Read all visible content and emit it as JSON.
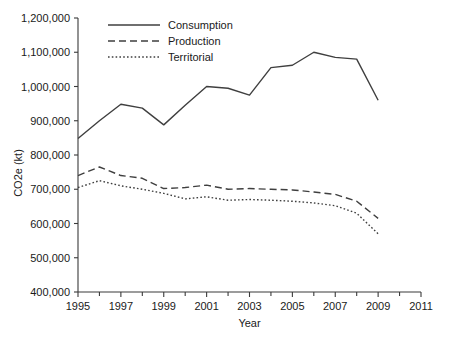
{
  "chart_data": {
    "type": "line",
    "title": "",
    "xlabel": "Year",
    "ylabel": "CO2e (kt)",
    "xlim": [
      1995,
      2011
    ],
    "ylim": [
      400000,
      1200000
    ],
    "grid": false,
    "legend_position": "top-center",
    "x_tick_labels": [
      "1995",
      "1997",
      "1999",
      "2001",
      "2003",
      "2005",
      "2007",
      "2009",
      "2011"
    ],
    "x_tick_values": [
      1995,
      1997,
      1999,
      2001,
      2003,
      2005,
      2007,
      2009,
      2011
    ],
    "x_minor_tick_values": [
      1996,
      1998,
      2000,
      2002,
      2004,
      2006,
      2008,
      2010
    ],
    "y_tick_labels": [
      "400,000",
      "500,000",
      "600,000",
      "700,000",
      "800,000",
      "900,000",
      "1,000,000",
      "1,100,000",
      "1,200,000"
    ],
    "y_tick_values": [
      400000,
      500000,
      600000,
      700000,
      800000,
      900000,
      1000000,
      1100000,
      1200000
    ],
    "x": [
      1995,
      1996,
      1997,
      1998,
      1999,
      2000,
      2001,
      2002,
      2003,
      2004,
      2005,
      2006,
      2007,
      2008,
      2009
    ],
    "series": [
      {
        "name": "Consumption",
        "style": "solid",
        "color": "#3f3f3f",
        "values": [
          848000,
          900000,
          948000,
          937000,
          888000,
          945000,
          1000000,
          995000,
          975000,
          1055000,
          1062000,
          1100000,
          1085000,
          1080000,
          960000
        ]
      },
      {
        "name": "Production",
        "style": "dashed",
        "color": "#3f3f3f",
        "values": [
          740000,
          765000,
          740000,
          732000,
          702000,
          705000,
          712000,
          700000,
          702000,
          700000,
          698000,
          692000,
          685000,
          665000,
          615000
        ]
      },
      {
        "name": "Territorial",
        "style": "dotted",
        "color": "#3f3f3f",
        "values": [
          705000,
          725000,
          710000,
          700000,
          688000,
          672000,
          678000,
          668000,
          670000,
          668000,
          665000,
          660000,
          652000,
          630000,
          570000
        ]
      }
    ]
  },
  "legend": {
    "items": [
      {
        "label": "Consumption",
        "style": "solid"
      },
      {
        "label": "Production",
        "style": "dashed"
      },
      {
        "label": "Territorial",
        "style": "dotted"
      }
    ]
  },
  "axes": {
    "x_title": "Year",
    "y_title": "CO2e (kt)"
  }
}
